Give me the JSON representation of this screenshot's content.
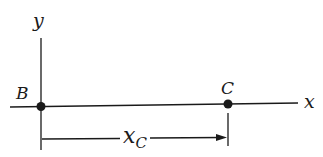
{
  "diagram": {
    "axes": {
      "x_label": "x",
      "y_label": "y"
    },
    "points": [
      {
        "id": "B",
        "label": "B"
      },
      {
        "id": "C",
        "label": "C"
      }
    ],
    "dimension": {
      "label_main": "x",
      "label_sub": "C",
      "description": "distance from B to C along x-axis"
    },
    "colors": {
      "stroke": "#1a1a1a",
      "background": "#ffffff"
    }
  }
}
